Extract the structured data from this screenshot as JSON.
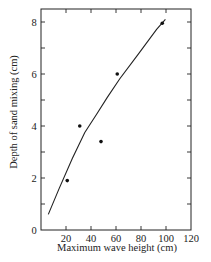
{
  "chart_data": {
    "type": "scatter",
    "title": "",
    "xlabel": "Maximum wave height (cm)",
    "ylabel": "Depth of sand mixing (cm)",
    "xlim": [
      0,
      120
    ],
    "ylim": [
      0,
      8.5
    ],
    "x_ticks": [
      20,
      40,
      60,
      80,
      100,
      120
    ],
    "x_tick_labels": [
      "20",
      "40",
      "60",
      "80",
      "100",
      "120"
    ],
    "y_ticks": [
      0,
      1,
      2,
      3,
      4,
      5,
      6,
      7,
      8
    ],
    "y_tick_labels": [
      "0",
      "",
      "2",
      "",
      "4",
      "",
      "6",
      "",
      "8"
    ],
    "grid": false,
    "legend": null,
    "series": [
      {
        "name": "Observations",
        "kind": "scatter",
        "points": [
          {
            "x": 21,
            "y": 1.9
          },
          {
            "x": 31,
            "y": 4.0
          },
          {
            "x": 48,
            "y": 3.4
          },
          {
            "x": 61,
            "y": 6.0
          },
          {
            "x": 97,
            "y": 7.95
          }
        ]
      },
      {
        "name": "Fitted curve",
        "kind": "line",
        "points": [
          {
            "x": 5.8,
            "y": 0.6
          },
          {
            "x": 14.4,
            "y": 1.58
          },
          {
            "x": 25,
            "y": 2.75
          },
          {
            "x": 35,
            "y": 3.75
          },
          {
            "x": 44.5,
            "y": 4.45
          },
          {
            "x": 53,
            "y": 5.1
          },
          {
            "x": 63,
            "y": 5.82
          },
          {
            "x": 77.8,
            "y": 6.76
          },
          {
            "x": 92.5,
            "y": 7.72
          },
          {
            "x": 99.5,
            "y": 8.1
          }
        ]
      }
    ]
  }
}
